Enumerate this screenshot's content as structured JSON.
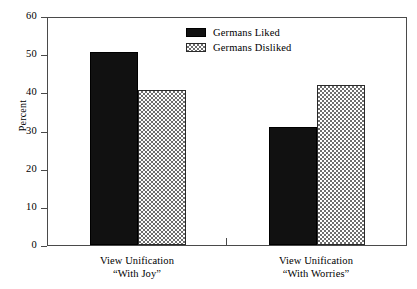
{
  "chart_data": {
    "type": "bar",
    "title": "",
    "xlabel": "",
    "ylabel": "Percent",
    "ylim": [
      0,
      60
    ],
    "yticks": [
      0,
      10,
      20,
      30,
      40,
      50,
      60
    ],
    "grid": false,
    "legend_position": "top-center",
    "categories": [
      "View Unification “With Joy”",
      "View Unification “With Worries”"
    ],
    "category_lines": [
      {
        "line1": "View Unification",
        "line2": "“With Joy”"
      },
      {
        "line1": "View Unification",
        "line2": "“With Worries”"
      }
    ],
    "series": [
      {
        "name": "Germans Liked",
        "values": [
          50.5,
          31.0
        ],
        "fill": "solid",
        "color": "#111111"
      },
      {
        "name": "Germans Disliked",
        "values": [
          40.5,
          41.8
        ],
        "fill": "hatched",
        "color": "#6e6e6e"
      }
    ]
  },
  "axis": {
    "y_title": "Percent",
    "y_tick_labels": [
      "60",
      "50",
      "40",
      "30",
      "20",
      "10",
      "0"
    ]
  },
  "legend": {
    "items": [
      {
        "label": "Germans Liked"
      },
      {
        "label": "Germans Disliked"
      }
    ]
  },
  "colors": {
    "frame": "#4a4a4a",
    "bar_liked": "#111111",
    "bar_disliked_hatch": "#6e6e6e",
    "background": "#ffffff"
  }
}
